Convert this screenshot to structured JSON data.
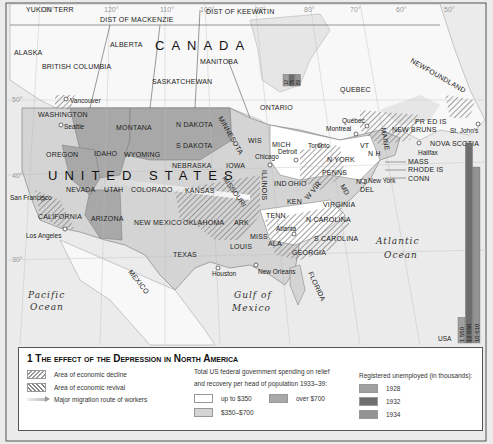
{
  "title": "1 The effect of the Depression in North America",
  "countries": {
    "canada": "CANADA",
    "usa": "UNITED STATES",
    "mexico": "MEXICO"
  },
  "oceans": {
    "pacific": [
      "Pacific",
      "Ocean"
    ],
    "atlantic": [
      "Atlantic",
      "Ocean"
    ],
    "gulf": [
      "Gulf of",
      "Mexico"
    ]
  },
  "canada_regions": [
    "YUKON TERR",
    "DIST OF MACKENZIE",
    "DIST OF KEEWATIN",
    "ALBERTA",
    "BRITISH COLUMBIA",
    "SASKATCHEWAN",
    "MANITOBA",
    "ONTARIO",
    "QUEBEC",
    "NEWFOUNDLAND",
    "NEW BRUNS",
    "PR ED IS",
    "NOVA SCOTIA",
    "ALASKA"
  ],
  "us_states": [
    "WASHINGTON",
    "OREGON",
    "IDAHO",
    "MONTANA",
    "WYOMING",
    "N DAKOTA",
    "S DAKOTA",
    "MINNESOTA",
    "NEBRASKA",
    "IOWA",
    "WIS",
    "MICH",
    "ILLINOIS",
    "IND",
    "OHIO",
    "NEVADA",
    "UTAH",
    "COLORADO",
    "KANSAS",
    "MISSOURI",
    "CALIFORNIA",
    "ARIZONA",
    "NEW MEXICO",
    "OKLAHOMA",
    "ARK",
    "TEXAS",
    "LOUIS",
    "MISS",
    "ALA",
    "GEORGIA",
    "FLORIDA",
    "TENN",
    "KEN",
    "VIRGINIA",
    "W VIR",
    "N CAROLINA",
    "S CAROLINA",
    "PENNS",
    "N YORK",
    "N J",
    "DEL",
    "MD",
    "VT",
    "N H",
    "MAINE",
    "MASS",
    "RHODE IS",
    "CONN"
  ],
  "cities": [
    "Vancouver",
    "Seattle",
    "San Francisco",
    "Los Angeles",
    "Chicago",
    "Detroit",
    "Toronto",
    "Montreal",
    "Québec",
    "Halifax",
    "St. John's",
    "New York",
    "Atlanta",
    "Houston",
    "New Orleans"
  ],
  "graticule": {
    "longitudes": [
      "130°",
      "120°",
      "110°",
      "100°",
      "90°",
      "80°",
      "70°",
      "60°",
      "50°"
    ],
    "latitudes": [
      "50°",
      "40°",
      "30°"
    ]
  },
  "legend": {
    "decline": "Area of economic decline",
    "revival": "Area of economic revival",
    "migration": "Major migration route of workers",
    "spending_title_1": "Total US federal government spending on relief",
    "spending_title_2": "and recovery per head of population 1933–39:",
    "spending": [
      {
        "label": "up to $350",
        "color": "#ffffff"
      },
      {
        "label": "$350–$700",
        "color": "#d4d4d4"
      },
      {
        "label": "over $700",
        "color": "#a8a8a8"
      }
    ],
    "unemployed_title": "Registered unemployed (in thousands):",
    "unemployed": [
      {
        "year": "1928",
        "color": "#a0a0a0"
      },
      {
        "year": "1932",
        "color": "#6e6e6e"
      },
      {
        "year": "1934",
        "color": "#939393"
      }
    ]
  },
  "chart_data": [
    {
      "type": "bar",
      "title": "Registered unemployed (in thousands) — USA",
      "categories": [
        "1928",
        "1932",
        "1934"
      ],
      "values": [
        1550,
        12060,
        10610
      ],
      "labels": [
        "1 550",
        "12 060",
        "10 610"
      ],
      "country_label": "USA"
    },
    {
      "type": "bar",
      "title": "Registered unemployed (in thousands) — Canada",
      "categories": [
        "1928",
        "1932",
        "1934"
      ],
      "values": [
        12,
        75,
        89
      ],
      "labels": [
        "12",
        "75",
        "89"
      ]
    }
  ],
  "colors": {
    "low": "#ffffff",
    "mid": "#d4d4d4",
    "high": "#a8a8a8",
    "water": "#ececec",
    "land": "#f7f7f7"
  }
}
